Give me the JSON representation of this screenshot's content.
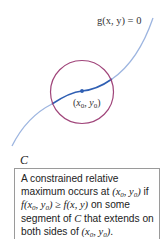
{
  "figure": {
    "constraint_label": "g(x, y) = 0",
    "point_label": "(x0, y0)",
    "curve_label": "C",
    "colors": {
      "curve_light": "#9db5e0",
      "curve_dark": "#2f5fb3",
      "circle": "#a0457a",
      "point": "#2f5fb3",
      "box_border": "#9a9a9a"
    }
  },
  "caption": {
    "line1": "A constrained relative",
    "line2_prefix": "maximum occurs at ",
    "line2_point": "(x0, y0)",
    "line2_suffix": " if",
    "line3_math": "f(x0, y0) ≥ f(x, y)",
    "line3_suffix": " on some",
    "line4_prefix": "segment of ",
    "line4_c": "C",
    "line4_suffix": " that extends on",
    "line5_prefix": "both sides of ",
    "line5_point": "(x0, y0)",
    "line5_suffix": "."
  }
}
